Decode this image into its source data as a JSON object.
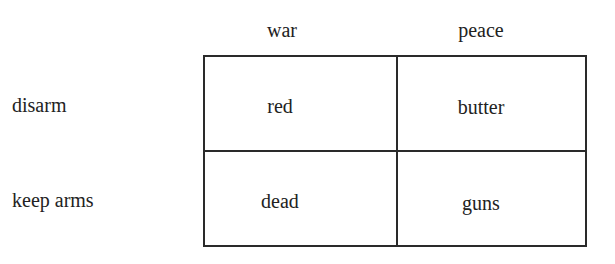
{
  "matrix": {
    "columns": [
      "war",
      "peace"
    ],
    "rows": [
      {
        "label": "disarm",
        "cells": [
          "red",
          "butter"
        ]
      },
      {
        "label": "keep arms",
        "cells": [
          "dead",
          "guns"
        ]
      }
    ]
  }
}
